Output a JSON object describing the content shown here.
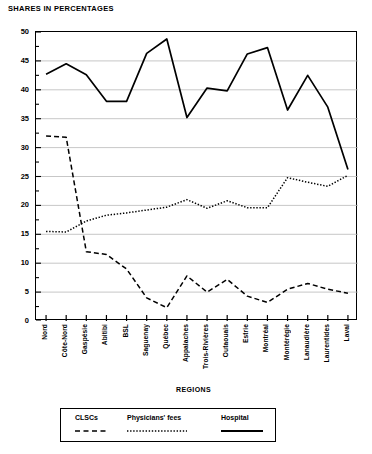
{
  "chart_data": {
    "type": "line",
    "title": "SHARES IN PERCENTAGES",
    "xlabel": "REGIONS",
    "ylabel": "",
    "ylim": [
      0,
      50
    ],
    "yticks": [
      0,
      5,
      10,
      15,
      20,
      25,
      30,
      35,
      40,
      45,
      50
    ],
    "grid": true,
    "legend_position": "bottom",
    "categories": [
      "Nord",
      "Côte-Nord",
      "Gaspésie",
      "Abitibi",
      "BSL",
      "Saguenay",
      "Québec",
      "Appalaches",
      "Trois-Rivières",
      "Outaouais",
      "Estrie",
      "Montréal",
      "Montérégie",
      "Lanaudière",
      "Laurentides",
      "Laval"
    ],
    "series": [
      {
        "name": "CLSCs",
        "style": "dashed",
        "values": [
          32.0,
          31.8,
          12.0,
          11.5,
          9.0,
          4.0,
          2.3,
          7.8,
          5.0,
          7.2,
          4.3,
          3.2,
          5.5,
          6.5,
          5.5,
          4.8
        ]
      },
      {
        "name": "Physicians' fees",
        "style": "dotted",
        "values": [
          15.5,
          15.4,
          17.3,
          18.3,
          18.7,
          19.2,
          19.7,
          21.0,
          19.5,
          20.8,
          19.6,
          19.6,
          24.8,
          24.0,
          23.3,
          25.2
        ]
      },
      {
        "name": "Hospital",
        "style": "solid",
        "values": [
          42.7,
          44.5,
          42.6,
          38.0,
          38.0,
          46.3,
          48.8,
          35.2,
          40.3,
          39.8,
          46.2,
          47.3,
          36.5,
          42.5,
          37.0,
          26.2
        ]
      }
    ]
  },
  "legend": {
    "items": [
      {
        "label": "CLSCs",
        "style": "dashed"
      },
      {
        "label": "Physicians' fees",
        "style": "dotted"
      },
      {
        "label": "Hospital",
        "style": "solid"
      }
    ]
  },
  "colors": {
    "ink": "#000000",
    "grid": "#b9b9b9",
    "background": "#ffffff"
  }
}
